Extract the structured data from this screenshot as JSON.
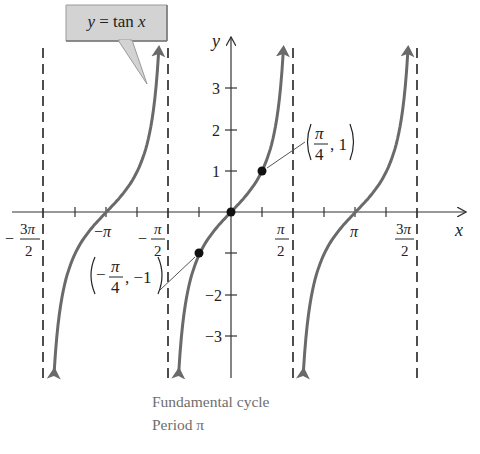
{
  "callout": {
    "label": "y = tan x"
  },
  "caption": {
    "line1": "Fundamental cycle",
    "line2": "Period π"
  },
  "axes": {
    "x_label": "x",
    "y_label": "y"
  },
  "colors": {
    "curve": "#6a6a6a",
    "axis": "#333333",
    "callout_fill": "#d3d3d3",
    "caption": "#6e6e6e"
  },
  "chart_data": {
    "type": "line",
    "title": "y = tan x",
    "xlabel": "x",
    "ylabel": "y",
    "function": "tan(x)",
    "xlim": [
      -4.9,
      5.9
    ],
    "ylim": [
      -4,
      4
    ],
    "grid": false,
    "x_ticks": [
      {
        "value": -4.712,
        "label": "-3π/2"
      },
      {
        "value": -3.927,
        "label": ""
      },
      {
        "value": -3.1416,
        "label": "-π"
      },
      {
        "value": -2.356,
        "label": ""
      },
      {
        "value": -1.5708,
        "label": "-π/2"
      },
      {
        "value": -0.785,
        "label": ""
      },
      {
        "value": 0.785,
        "label": ""
      },
      {
        "value": 1.5708,
        "label": "π/2"
      },
      {
        "value": 2.356,
        "label": ""
      },
      {
        "value": 3.1416,
        "label": "π"
      },
      {
        "value": 3.927,
        "label": ""
      },
      {
        "value": 4.712,
        "label": "3π/2"
      }
    ],
    "y_ticks": [
      -3,
      -2,
      -1,
      1,
      2,
      3
    ],
    "y_tick_labels": [
      "-3",
      "-2",
      "",
      "1",
      "2",
      "3"
    ],
    "asymptotes": [
      {
        "x": -4.712,
        "label": "x = -3π/2"
      },
      {
        "x": -1.5708,
        "label": "x = -π/2"
      },
      {
        "x": 1.5708,
        "label": "x = π/2"
      },
      {
        "x": 4.712,
        "label": "x = 3π/2"
      }
    ],
    "branches": [
      {
        "interval": [
          -4.712,
          -1.5708
        ],
        "zero": -3.1416
      },
      {
        "interval": [
          -1.5708,
          1.5708
        ],
        "zero": 0,
        "fundamental": true
      },
      {
        "interval": [
          1.5708,
          4.712
        ],
        "zero": 3.1416
      }
    ],
    "highlighted_points": [
      {
        "x": -0.785,
        "y": -1,
        "label": "(-π/4, -1)"
      },
      {
        "x": 0,
        "y": 0,
        "label": ""
      },
      {
        "x": 0.785,
        "y": 1,
        "label": "(π/4, 1)"
      }
    ],
    "annotations": [
      "Fundamental cycle",
      "Period π"
    ],
    "period": "π"
  }
}
